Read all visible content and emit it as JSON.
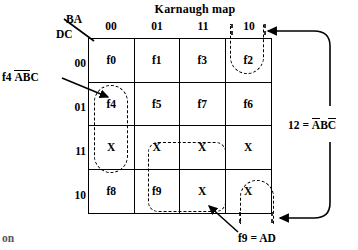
{
  "title": "Karnaugh map",
  "axes": {
    "column_variable_label": "BA",
    "row_variable_label": "DC",
    "column_headers": [
      "00",
      "01",
      "11",
      "10"
    ],
    "row_headers": [
      "00",
      "01",
      "11",
      "10"
    ]
  },
  "grid": {
    "rows": [
      {
        "row_label": "00",
        "cells": [
          "f0",
          "f1",
          "f3",
          "f2"
        ]
      },
      {
        "row_label": "01",
        "cells": [
          "f4",
          "f5",
          "f7",
          "f6"
        ]
      },
      {
        "row_label": "11",
        "cells": [
          "X",
          "X",
          "X",
          "X"
        ]
      },
      {
        "row_label": "10",
        "cells": [
          "f8",
          "f9",
          "X",
          "X"
        ]
      }
    ]
  },
  "annotations": {
    "left": {
      "prefix": "f4",
      "term_a": "A",
      "term_b": "B",
      "term_c": "C"
    },
    "right": {
      "number": "12",
      "equals": "=",
      "term_a": "A",
      "term_b": "B",
      "term_c": "C"
    },
    "bottom": {
      "text": "f9 = AD"
    },
    "page_fragment": "on"
  },
  "colors": {
    "ink": "#000000",
    "background": "#ffffff"
  }
}
